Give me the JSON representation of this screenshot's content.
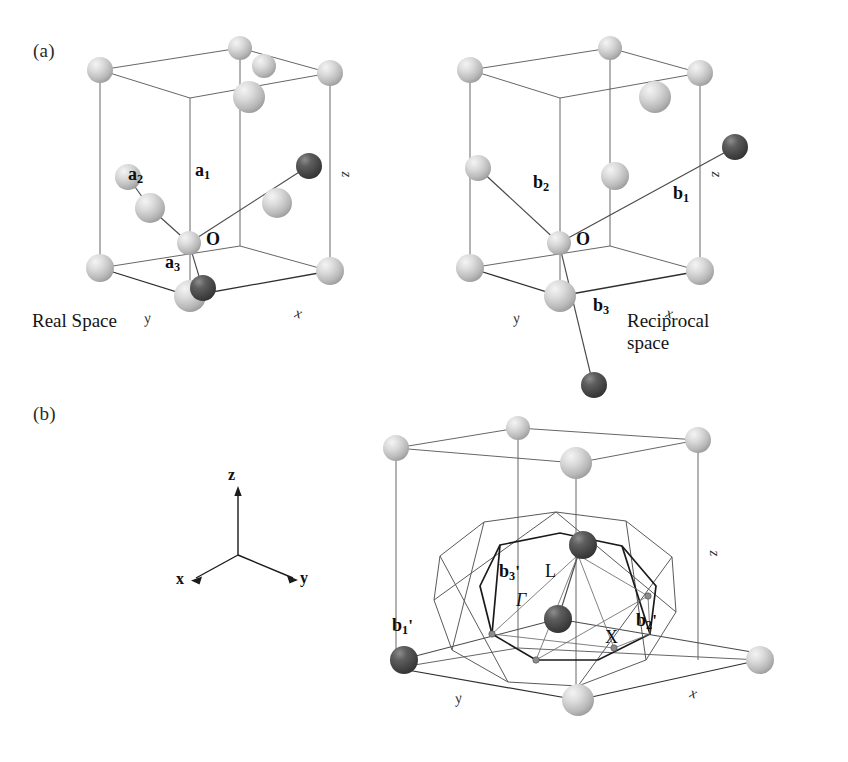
{
  "figure": {
    "background": "#ffffff",
    "sphere_light": "#cfcfcf",
    "sphere_dark": "#4e4e4e",
    "line_color": "#3a3a3a",
    "bz_color": "#1c1c1c"
  },
  "panels": {
    "a": {
      "label": "(a)",
      "left": {
        "caption": "Real Space",
        "origin_label": "O",
        "vectors": [
          {
            "name": "a1",
            "base": "a",
            "sub": "1",
            "prime": ""
          },
          {
            "name": "a2",
            "base": "a",
            "sub": "2",
            "prime": ""
          },
          {
            "name": "a3",
            "base": "a",
            "sub": "3",
            "prime": ""
          }
        ],
        "axes": [
          {
            "name": "x",
            "label": "x"
          },
          {
            "name": "y",
            "label": "y"
          },
          {
            "name": "z",
            "label": "z"
          }
        ]
      },
      "right": {
        "caption": "Reciprocal\nspace",
        "origin_label": "O",
        "vectors": [
          {
            "name": "b1",
            "base": "b",
            "sub": "1",
            "prime": ""
          },
          {
            "name": "b2",
            "base": "b",
            "sub": "2",
            "prime": ""
          },
          {
            "name": "b3",
            "base": "b",
            "sub": "3",
            "prime": ""
          }
        ],
        "axes": [
          {
            "name": "x",
            "label": "x"
          },
          {
            "name": "y",
            "label": "y"
          },
          {
            "name": "z",
            "label": "z"
          }
        ]
      }
    },
    "b": {
      "label": "(b)",
      "triad": {
        "x_label": "x",
        "y_label": "y",
        "z_label": "z"
      },
      "vectors": [
        {
          "name": "b1prime",
          "base": "b",
          "sub": "1",
          "prime": "'"
        },
        {
          "name": "b2prime",
          "base": "b",
          "sub": "2",
          "prime": "'"
        },
        {
          "name": "b3prime",
          "base": "b",
          "sub": "3",
          "prime": "'"
        }
      ],
      "symmetry_points": [
        {
          "name": "gamma",
          "label": "Γ",
          "style": "italic"
        },
        {
          "name": "L",
          "label": "L",
          "style": "roman"
        },
        {
          "name": "X",
          "label": "X",
          "style": "roman"
        }
      ],
      "axes": [
        {
          "name": "x",
          "label": "x"
        },
        {
          "name": "y",
          "label": "y"
        },
        {
          "name": "z",
          "label": "z"
        }
      ]
    }
  }
}
